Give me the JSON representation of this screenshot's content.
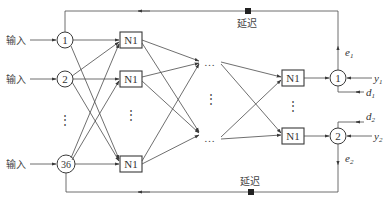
{
  "diagram": {
    "type": "neural-network-block-diagram",
    "inputs": [
      {
        "label": "输入",
        "node": "1"
      },
      {
        "label": "输入",
        "node": "2"
      },
      {
        "label": "输入",
        "node": "36"
      }
    ],
    "input_ellipsis": "⋮",
    "hidden_first_layer": {
      "label": "N1",
      "count_shown": 3,
      "ellipsis": "⋮"
    },
    "hidden_middle": {
      "ellipsis_h": "…",
      "ellipsis_v": "⋮"
    },
    "output_layer": {
      "label": "N1",
      "count_shown": 2,
      "ellipsis": "⋮"
    },
    "summing_nodes": [
      {
        "label": "1",
        "output": "y",
        "output_sub": "1",
        "desired": "d",
        "desired_sub": "1",
        "error": "e",
        "error_sub": "1"
      },
      {
        "label": "2",
        "output": "y",
        "output_sub": "2",
        "desired": "d",
        "desired_sub": "2",
        "error": "e",
        "error_sub": "2"
      }
    ],
    "feedback_top_label": "延迟",
    "feedback_bottom_label": "延迟"
  }
}
